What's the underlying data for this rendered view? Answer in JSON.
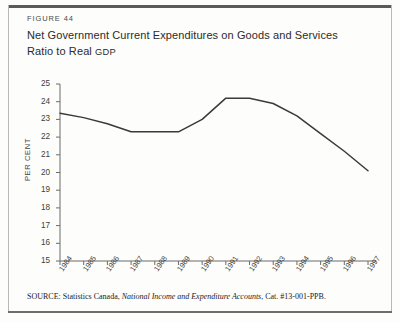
{
  "figure": {
    "number_label": "FIGURE 44",
    "title_line1": "Net Government Current Expenditures on Goods and Services",
    "title_line2_prefix": "Ratio to Real ",
    "title_line2_smallcaps": "GDP"
  },
  "source": {
    "label": "SOURCE:",
    "agency": "Statistics Canada,",
    "publication": "National Income and Expenditure Accounts",
    "catalogue": ", Cat. #13-001-PPB."
  },
  "colors": {
    "line": "#3a3a3a",
    "axis": "#6b6b6b",
    "text": "#2b2b2b",
    "rule": "#5a5a5a",
    "background": "#fdfdfb"
  },
  "chart_data": {
    "type": "line",
    "title": "Net Government Current Expenditures on Goods and Services",
    "subtitle": "Ratio to Real GDP",
    "xlabel": "",
    "ylabel": "PER CENT",
    "ylim": [
      15,
      25
    ],
    "ytick_labels": [
      "25",
      "24",
      "23",
      "22",
      "21",
      "20",
      "19",
      "18",
      "17",
      "16",
      "15"
    ],
    "yticks": [
      25,
      24,
      23,
      22,
      21,
      20,
      19,
      18,
      17,
      16,
      15
    ],
    "categories": [
      "1984",
      "1985",
      "1986",
      "1987",
      "1988",
      "1989",
      "1990",
      "1991",
      "1992",
      "1993",
      "1994",
      "1995",
      "1996",
      "1997"
    ],
    "x": [
      1984,
      1985,
      1986,
      1987,
      1988,
      1989,
      1990,
      1991,
      1992,
      1993,
      1994,
      1995,
      1996,
      1997
    ],
    "values": [
      23.35,
      23.1,
      22.75,
      22.3,
      22.3,
      22.3,
      23.0,
      24.2,
      24.2,
      23.9,
      23.2,
      22.2,
      21.2,
      20.1
    ],
    "grid": false,
    "legend": false
  }
}
